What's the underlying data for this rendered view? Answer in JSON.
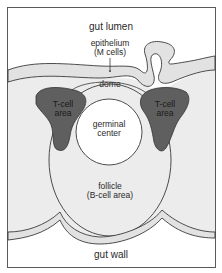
{
  "diagram": {
    "type": "anatomical cross-section",
    "colors": {
      "frame": "#555555",
      "epithelium_fill": "#e2e2e2",
      "tissue_fill": "#ececec",
      "tcell_fill": "#5f5f5f",
      "germinal_fill": "#ffffff",
      "outline": "#3a3a3a"
    },
    "labels": {
      "gut_lumen": "gut lumen",
      "epithelium_line1": "epithelium",
      "epithelium_line2": "(M cells)",
      "dome": "dome",
      "tcell_left_line1": "T-cell",
      "tcell_left_line2": "area",
      "tcell_right_line1": "T-cell",
      "tcell_right_line2": "area",
      "germinal_line1": "germinal",
      "germinal_line2": "center",
      "follicle_line1": "follicle",
      "follicle_line2": "(B-cell area)",
      "gut_wall": "gut wall"
    }
  }
}
